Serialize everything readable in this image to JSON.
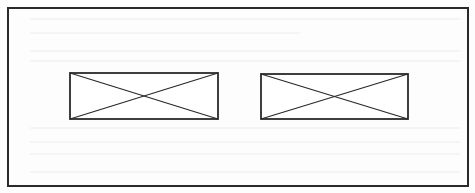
{
  "diagram": {
    "type": "wireframe-layout",
    "colors": {
      "stroke": "#2a2a2a",
      "background": "#fdfdfd",
      "bleed_through": "#ececec"
    },
    "frame": {
      "label": "",
      "x": 8,
      "y": 8,
      "width": 460,
      "height": 178
    },
    "placeholders": [
      {
        "name": "image-placeholder-left",
        "icon": "crossed-box-icon",
        "x": 70,
        "y": 73,
        "width": 148,
        "height": 46
      },
      {
        "name": "image-placeholder-right",
        "icon": "crossed-box-icon",
        "x": 261,
        "y": 74,
        "width": 147,
        "height": 45
      }
    ]
  }
}
